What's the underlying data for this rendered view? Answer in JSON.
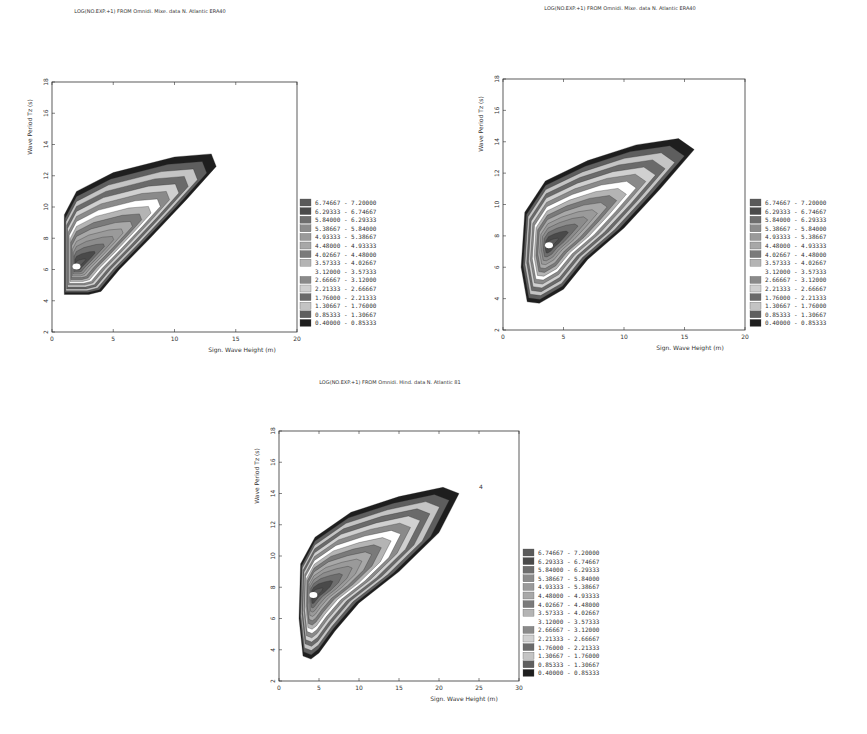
{
  "chart_data": [
    {
      "type": "heatmap",
      "subtype": "filled-contour",
      "title": "LOG(NO.EXP.+1) FROM Omnidi. Mixe. data N. Atlantic ERA40",
      "xlabel": "Sign. Wave Height (m)",
      "ylabel": "Wave Period Tz (s)",
      "xlim": [
        0,
        20
      ],
      "ylim": [
        2,
        18
      ],
      "xticks": [
        "0",
        "5",
        "10",
        "15",
        "20"
      ],
      "yticks": [
        "2",
        "4",
        "6",
        "8",
        "10",
        "12",
        "14",
        "16",
        "18"
      ],
      "region": {
        "outline": [
          [
            1,
            4.4
          ],
          [
            1,
            9.5
          ],
          [
            2,
            11
          ],
          [
            5,
            12.2
          ],
          [
            10,
            13.2
          ],
          [
            13,
            13.4
          ],
          [
            13.4,
            12.6
          ],
          [
            11,
            10.5
          ],
          [
            8,
            8
          ],
          [
            5.5,
            6
          ],
          [
            4,
            4.6
          ],
          [
            3,
            4.4
          ]
        ],
        "peak": [
          2,
          6.2
        ],
        "max_value": 7.2
      },
      "legend": {
        "placement": "right",
        "intervals": [
          "6.74667 - 7.20000",
          "6.29333 - 6.74667",
          "5.84000 - 6.29333",
          "5.38667 - 5.84000",
          "4.93333 - 5.38667",
          "4.48000 - 4.93333",
          "4.02667 - 4.48000",
          "3.57333 - 4.02667",
          "3.12000 - 3.57333",
          "2.66667 - 3.12000",
          "2.21333 - 2.66667",
          "1.76000 - 2.21333",
          "1.30667 - 1.76000",
          "0.85333 - 1.30667",
          "0.40000 - 0.85333"
        ]
      }
    },
    {
      "type": "heatmap",
      "subtype": "filled-contour",
      "title": "LOG(NO.EXP.+1) FROM Omnidi. Mixe. data N. Atlantic ERA40",
      "xlabel": "Sign. Wave Height (m)",
      "ylabel": "Wave Period Tz (s)",
      "xlim": [
        0,
        20
      ],
      "ylim": [
        2,
        18
      ],
      "xticks": [
        "0",
        "5",
        "10",
        "15",
        "20"
      ],
      "yticks": [
        "2",
        "4",
        "6",
        "8",
        "10",
        "12",
        "14",
        "16",
        "18"
      ],
      "region": {
        "outline": [
          [
            2,
            3.8
          ],
          [
            1.5,
            6
          ],
          [
            1.8,
            9.5
          ],
          [
            3.5,
            11.5
          ],
          [
            7,
            12.8
          ],
          [
            11,
            13.8
          ],
          [
            14.5,
            14.2
          ],
          [
            15.8,
            13.5
          ],
          [
            13,
            11
          ],
          [
            10,
            8.5
          ],
          [
            7,
            6.5
          ],
          [
            5,
            4.6
          ],
          [
            3,
            3.7
          ]
        ],
        "peak": [
          3.8,
          7.4
        ],
        "max_value": 7.2
      },
      "legend": {
        "placement": "right",
        "intervals": [
          "6.74667 - 7.20000",
          "6.29333 - 6.74667",
          "5.84000 - 6.29333",
          "5.38667 - 5.84000",
          "4.93333 - 5.38667",
          "4.48000 - 4.93333",
          "4.02667 - 4.48000",
          "3.57333 - 4.02667",
          "3.12000 - 3.57333",
          "2.66667 - 3.12000",
          "2.21333 - 2.66667",
          "1.76000 - 2.21333",
          "1.30667 - 1.76000",
          "0.85333 - 1.30667",
          "0.40000 - 0.85333"
        ]
      }
    },
    {
      "type": "heatmap",
      "subtype": "filled-contour",
      "title": "LOG(NO.EXP.+1) FROM Omnidi. Hind. data N. Atlantic 81",
      "xlabel": "Sign. Wave Height (m)",
      "ylabel": "Wave Period Tz (s)",
      "xlim": [
        0,
        30
      ],
      "ylim": [
        2,
        18
      ],
      "xticks": [
        "0",
        "5",
        "10",
        "15",
        "20",
        "25",
        "30"
      ],
      "yticks": [
        "2",
        "4",
        "6",
        "8",
        "10",
        "12",
        "14",
        "16",
        "18"
      ],
      "annotations": [
        {
          "text": "4",
          "x": 25,
          "y": 14.3
        }
      ],
      "region": {
        "outline": [
          [
            3,
            3.6
          ],
          [
            2.5,
            6
          ],
          [
            2.7,
            9.5
          ],
          [
            4.5,
            11.2
          ],
          [
            9,
            12.8
          ],
          [
            15,
            13.8
          ],
          [
            20.5,
            14.4
          ],
          [
            22.5,
            14
          ],
          [
            20,
            11.5
          ],
          [
            15,
            9
          ],
          [
            10,
            7
          ],
          [
            7,
            5.2
          ],
          [
            5,
            3.8
          ],
          [
            4,
            3.4
          ]
        ],
        "peak": [
          4.3,
          7.5
        ],
        "max_value": 7.2
      },
      "legend": {
        "placement": "right",
        "intervals": [
          "6.74667 - 7.20000",
          "6.29333 - 6.74667",
          "5.84000 - 6.29333",
          "5.38667 - 5.84000",
          "4.93333 - 5.38667",
          "4.48000 - 4.93333",
          "4.02667 - 4.48000",
          "3.57333 - 4.02667",
          "3.12000 - 3.57333",
          "2.66667 - 3.12000",
          "2.21333 - 2.66667",
          "1.76000 - 2.21333",
          "1.30667 - 1.76000",
          "0.85333 - 1.30667",
          "0.40000 - 0.85333"
        ]
      }
    }
  ],
  "legend_colors": [
    "#5a5a5a",
    "#4a4a4a",
    "#6e6e6e",
    "#8c8c8c",
    "#9a9a9a",
    "#a8a8a8",
    "#7a7a7a",
    "#b4b4b4",
    "#ffffff",
    "#8a8a8a",
    "#d0d0d0",
    "#6a6a6a",
    "#c4c4c4",
    "#5e5e5e",
    "#1e1e1e"
  ]
}
